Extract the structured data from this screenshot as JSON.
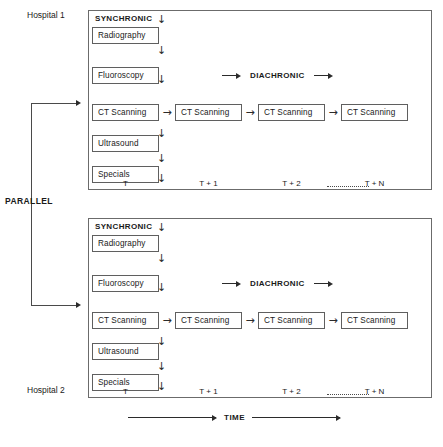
{
  "figure": {
    "parallel_label": "PARALLEL",
    "time_axis_label": "TIME"
  },
  "panels": [
    {
      "hospital_label": "Hospital 1",
      "synchronic_label": "SYNCHRONIC",
      "diachronic_label": "DIACHRONIC",
      "modalities": [
        "Radiography",
        "Fluoroscopy",
        "CT Scanning",
        "Ultrasound",
        "Specials"
      ],
      "diachronic_boxes": [
        "CT Scanning",
        "CT Scanning",
        "CT Scanning",
        "CT Scanning"
      ],
      "time_ticks": [
        "T",
        "T + 1",
        "T + 2",
        "T + N"
      ]
    },
    {
      "hospital_label": "Hospital 2",
      "synchronic_label": "SYNCHRONIC",
      "diachronic_label": "DIACHRONIC",
      "modalities": [
        "Radiography",
        "Fluoroscopy",
        "CT Scanning",
        "Ultrasound",
        "Specials"
      ],
      "diachronic_boxes": [
        "CT Scanning",
        "CT Scanning",
        "CT Scanning",
        "CT Scanning"
      ],
      "time_ticks": [
        "T",
        "T + 1",
        "T + 2",
        "T + N"
      ]
    }
  ],
  "icons": {
    "down_arrow": "↓",
    "right_arrow": "→"
  },
  "colors": {
    "box_border": "#5f5f5f",
    "panel_border": "#6b6b6b",
    "ink": "#1a1a1a",
    "line": "#4a4a4a",
    "background": "#ffffff"
  }
}
